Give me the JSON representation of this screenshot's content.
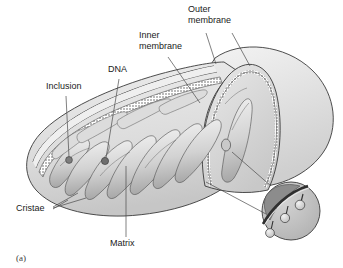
{
  "figure": {
    "caption": "(a)",
    "background_color": "#ffffff"
  },
  "labels": [
    {
      "id": "outer-membrane",
      "text_lines": [
        "Outer",
        "membrane"
      ],
      "x": 188,
      "y": 12,
      "line_height": 11
    },
    {
      "id": "inner-membrane",
      "text_lines": [
        "Inner",
        "membrane"
      ],
      "x": 139,
      "y": 38,
      "line_height": 11
    },
    {
      "id": "dna",
      "text_lines": [
        "DNA"
      ],
      "x": 108,
      "y": 72,
      "line_height": 11
    },
    {
      "id": "inclusion",
      "text_lines": [
        "Inclusion"
      ],
      "x": 46,
      "y": 89,
      "line_height": 11
    },
    {
      "id": "cristae",
      "text_lines": [
        "Cristae"
      ],
      "x": 16,
      "y": 211,
      "line_height": 11
    },
    {
      "id": "matrix",
      "text_lines": [
        "Matrix"
      ],
      "x": 110,
      "y": 246,
      "line_height": 11
    }
  ],
  "colors": {
    "outline": "#3a3a3a",
    "membrane_dark": "#5a5a5a",
    "matrix_light": "#d8d8d8",
    "matrix_mid": "#b9b9b9",
    "cristae_light": "#e2e2e2",
    "cristae_shadow": "#9a9a9a",
    "body_fill": "#e6e6e6",
    "inset_dark": "#8c8c8c",
    "leader_line": "#4a4a4a",
    "text": "#1a1a1a"
  },
  "structures": {
    "outer_membrane": "smooth continuous outer boundary of the organelle",
    "inner_membrane": "inner boundary folded into cristae",
    "cristae": "folded shelf-like invaginations of the inner membrane",
    "matrix": "interior compartment enclosed by the inner membrane",
    "dna": "dark circular granule within the matrix",
    "inclusion": "dense granule body within the matrix",
    "inset_detail": "magnified circular callout showing membrane with three stalked ATP-synthase particles"
  },
  "inset": {
    "id": "atp-synthase-detail",
    "center_x": 291,
    "center_y": 211,
    "radius": 29,
    "particle_count": 3
  }
}
